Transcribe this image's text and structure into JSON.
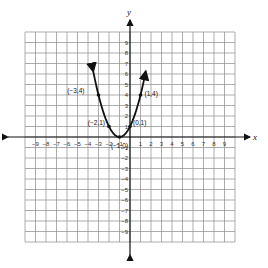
{
  "chart_data": {
    "type": "line",
    "title": "",
    "xlabel": "x",
    "ylabel": "y",
    "xlim": [
      -10,
      10
    ],
    "ylim": [
      -10,
      10
    ],
    "grid": true,
    "x_ticks": [
      -9,
      -8,
      -7,
      -6,
      -5,
      -4,
      -3,
      -2,
      -1,
      1,
      2,
      3,
      4,
      5,
      6,
      7,
      8,
      9
    ],
    "y_ticks": [
      9,
      8,
      7,
      6,
      5,
      4,
      3,
      2,
      1,
      -1,
      -2,
      -3,
      -4,
      -5,
      -6,
      -7,
      -8,
      -9
    ],
    "series": [
      {
        "name": "parabola y=(x+1)^2",
        "curve_range": [
          -3.5,
          1.5
        ],
        "arrows_both_ends": true,
        "points": [
          {
            "x": -3,
            "y": 4,
            "label": "(−3,4)"
          },
          {
            "x": -2,
            "y": 1,
            "label": "(−2,1)"
          },
          {
            "x": -1,
            "y": 0,
            "label": "(−1,0)"
          },
          {
            "x": 0,
            "y": 1,
            "label": "(0,1)"
          },
          {
            "x": 1,
            "y": 4,
            "label": "(1,4)"
          }
        ]
      }
    ]
  }
}
